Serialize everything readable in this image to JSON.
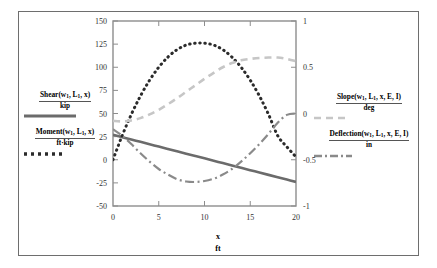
{
  "chart_data": {
    "type": "line",
    "title": "",
    "xlabel": "x",
    "xunits": "ft",
    "xlim": [
      0,
      20
    ],
    "xticks": [
      "0",
      "5",
      "10",
      "15",
      "20"
    ],
    "xtickvals": [
      0,
      5,
      10,
      15,
      20
    ],
    "grid": false,
    "legend_position": "outside-left-and-right",
    "left_axis": {
      "ylim": [
        -50,
        150
      ],
      "yticks": [
        "150",
        "125",
        "100",
        "75",
        "50",
        "25",
        "0",
        "-25",
        "-50"
      ],
      "ytickvals": [
        150,
        125,
        100,
        75,
        50,
        25,
        0,
        -25,
        -50
      ]
    },
    "right_axis": {
      "ylim": [
        -1,
        1
      ],
      "yticks": [
        "1",
        "0.5",
        "0",
        "-0.5",
        "-1"
      ],
      "ytickvals": [
        1,
        0.5,
        0,
        -0.5,
        -1
      ]
    },
    "x": [
      0,
      1,
      2,
      3,
      4,
      5,
      6,
      7,
      8,
      9,
      10,
      11,
      12,
      13,
      14,
      15,
      16,
      17,
      18,
      19,
      20
    ],
    "series": [
      {
        "name": "Shear(w1, L1, x)",
        "units": "kip",
        "axis": "left",
        "style": "solid",
        "color": "#6b6b6b",
        "width": 2.6,
        "values": [
          27,
          24.45,
          21.9,
          19.35,
          16.8,
          14.25,
          11.7,
          9.15,
          6.6,
          4.05,
          1.5,
          -1.05,
          -3.6,
          -6.15,
          -8.7,
          -11.25,
          -13.8,
          -16.35,
          -18.9,
          -21.45,
          -24
        ]
      },
      {
        "name": "Moment(w1, L1, x)",
        "units": "ft·kip",
        "axis": "left",
        "style": "dotted",
        "color": "#2b2b2b",
        "width": 3.0,
        "values": [
          0,
          26,
          49,
          69,
          86,
          100,
          111,
          119,
          124,
          126,
          126,
          124,
          119,
          111,
          100,
          86,
          69,
          49,
          26,
          14,
          3
        ]
      },
      {
        "name": "Slope(w1, L1, x, E, I)",
        "units": "deg",
        "axis": "right",
        "style": "dashed",
        "color": "#c6c6c6",
        "width": 2.6,
        "values": [
          -0.08,
          -0.085,
          -0.075,
          -0.05,
          -0.01,
          0.04,
          0.1,
          0.165,
          0.235,
          0.305,
          0.375,
          0.44,
          0.5,
          0.545,
          0.575,
          0.59,
          0.6,
          0.605,
          0.605,
          0.59,
          0.565
        ]
      },
      {
        "name": "Deflection(w1, L1, x, E, I)",
        "units": "in",
        "axis": "right",
        "style": "dashdot",
        "color": "#8a8a8a",
        "width": 2.2,
        "values": [
          -0.17,
          -0.24,
          -0.33,
          -0.43,
          -0.52,
          -0.6,
          -0.66,
          -0.71,
          -0.735,
          -0.74,
          -0.73,
          -0.705,
          -0.66,
          -0.6,
          -0.52,
          -0.43,
          -0.33,
          -0.22,
          -0.1,
          -0.015,
          0.0
        ]
      }
    ]
  },
  "legend_left": {
    "entries": [
      {
        "name": "Shear",
        "args_pre": "w",
        "sub1": "1",
        "args_mid": ", L",
        "sub2": "1",
        "args_post": ", x",
        "units": "kip",
        "style": "solid",
        "color": "#6b6b6b"
      },
      {
        "name": "Moment",
        "args_pre": "w",
        "sub1": "1",
        "args_mid": ", L",
        "sub2": "1",
        "args_post": ", x",
        "units": "ft·kip",
        "style": "dotted",
        "color": "#2b2b2b"
      }
    ]
  },
  "legend_right": {
    "entries": [
      {
        "name": "Slope",
        "args_pre": "w",
        "sub1": "1",
        "args_mid": ", L",
        "sub2": "1",
        "args_post": ", x, E, I",
        "units": "deg",
        "style": "dashed",
        "color": "#c6c6c6"
      },
      {
        "name": "Deflection",
        "args_pre": "w",
        "sub1": "1",
        "args_mid": ", L",
        "sub2": "1",
        "args_post": ", x, E, I",
        "units": "in",
        "style": "dashdot",
        "color": "#8a8a8a"
      }
    ]
  },
  "axis_titles": {
    "x_name": "x",
    "x_units": "ft"
  }
}
